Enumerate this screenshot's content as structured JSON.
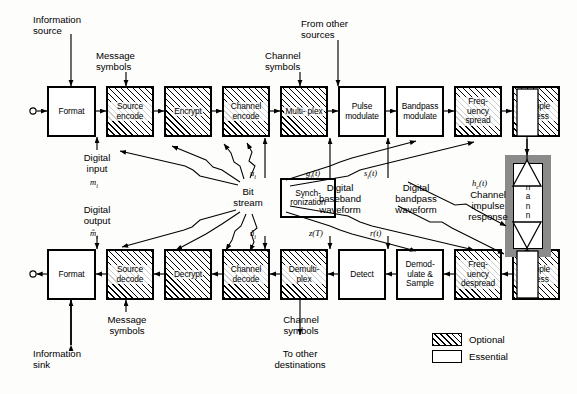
{
  "diagram": {
    "legend": {
      "optional_label": "Optional",
      "essential_label": "Essential"
    },
    "transmit_chain": [
      {
        "id": "format-tx",
        "label": "Format",
        "type": "essential"
      },
      {
        "id": "source-encode",
        "label": "Source\nencode",
        "type": "optional"
      },
      {
        "id": "encrypt",
        "label": "Encrypt",
        "type": "optional"
      },
      {
        "id": "channel-encode",
        "label": "Channel\nencode",
        "type": "optional"
      },
      {
        "id": "multiplex",
        "label": "Multi-\nplex",
        "type": "optional"
      },
      {
        "id": "pulse-modulate",
        "label": "Pulse\nmodulate",
        "type": "essential"
      },
      {
        "id": "bandpass-modulate",
        "label": "Bandpass\nmodulate",
        "type": "essential"
      },
      {
        "id": "frequency-spread",
        "label": "Freq-\nuency\nspread",
        "type": "optional"
      },
      {
        "id": "multiple-access-tx",
        "label": "Multiple\naccess",
        "type": "optional"
      }
    ],
    "receive_chain": [
      {
        "id": "format-rx",
        "label": "Format",
        "type": "essential"
      },
      {
        "id": "source-decode",
        "label": "Source\ndecode",
        "type": "optional"
      },
      {
        "id": "decrypt",
        "label": "Decrypt",
        "type": "optional"
      },
      {
        "id": "channel-decode",
        "label": "Channel\ndecode",
        "type": "optional"
      },
      {
        "id": "demultiplex",
        "label": "Demulti-\nplex",
        "type": "optional"
      },
      {
        "id": "detect",
        "label": "Detect",
        "type": "essential"
      },
      {
        "id": "demodulate-sample",
        "label": "Demod-\nulate\n& Sample",
        "type": "essential"
      },
      {
        "id": "frequency-despread",
        "label": "Freq-\nuency\ndespread",
        "type": "optional"
      },
      {
        "id": "multiple-access-rx",
        "label": "Multiple\naccess",
        "type": "optional"
      }
    ],
    "terminals": {
      "xmt": "X\nM\nT",
      "rcv": "R\nC\nV",
      "channel": "Channel"
    },
    "sync_block": "Synch-\nronization",
    "labels": {
      "information_source": "Information\nsource",
      "message_symbols_top": "Message\nsymbols",
      "channel_symbols_top": "Channel\nsymbols",
      "from_other_sources": "From other\nsources",
      "digital_input": "Digital\ninput",
      "bit_stream": "Bit\nstream",
      "digital_baseband_waveform": "Digital\nbaseband\nwaveform",
      "digital_bandpass_waveform": "Digital\nbandpass\nwaveform",
      "channel_impulse_response": "Channel\nimpulse\nresponse",
      "digital_output": "Digital\noutput",
      "message_symbols_bottom": "Message\nsymbols",
      "channel_symbols_bottom": "Channel\nsymbols",
      "to_other_destinations": "To other\ndestinations",
      "information_sink": "Information\nsink"
    },
    "math": {
      "m_i": "m",
      "m_i_sub": "i",
      "u_i": "u",
      "u_i_sub": "i",
      "g_i_t": "g",
      "g_i_sub": "i",
      "g_i_arg": "(t)",
      "s_i_t": "s",
      "s_i_sub": "i",
      "s_i_arg": "(t)",
      "h_c_t": "h",
      "h_c_sub": "c",
      "h_c_arg": "(t)",
      "m_hat": "m̂",
      "m_hat_sub": "i",
      "u_hat": "û",
      "u_hat_sub": "i",
      "z_T": "z(T)",
      "r_t": "r",
      "r_arg": "(t)"
    },
    "colors": {
      "ink": "#000000",
      "paper": "#fdfdfc",
      "channel_band": "#8b8b8b"
    }
  }
}
